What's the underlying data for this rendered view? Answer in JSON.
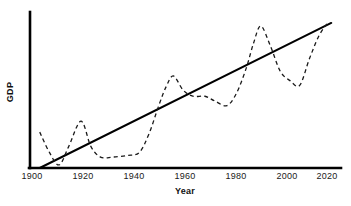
{
  "chart_data": {
    "type": "line",
    "title": "",
    "xlabel": "Year",
    "ylabel": "GDP",
    "xlim": [
      1896,
      2024
    ],
    "ylim": [
      0,
      100
    ],
    "grid": false,
    "legend": false,
    "xticks": [
      "1900",
      "1920",
      "1940",
      "1960",
      "1980",
      "2000",
      "2020"
    ],
    "xtick_values": [
      1900,
      1920,
      1940,
      1960,
      1980,
      2000,
      2020
    ],
    "yticks": [],
    "series": [
      {
        "name": "GDP trend",
        "style": "solid",
        "color": "#000000",
        "width": 2,
        "x": [
          1900,
          2020
        ],
        "values": [
          0,
          93
        ]
      },
      {
        "name": "GDP actual",
        "style": "dashed",
        "color": "#1a1a1a",
        "width": 1.3,
        "x": [
          1900,
          1904,
          1908,
          1912,
          1917,
          1921,
          1925,
          1930,
          1936,
          1941,
          1945,
          1949,
          1952,
          1955,
          1959,
          1963,
          1968,
          1972,
          1977,
          1981,
          1985,
          1988,
          1991,
          1995,
          1999,
          2003,
          2007,
          2011,
          2015,
          2019
        ],
        "values": [
          23,
          10,
          2,
          14,
          30,
          14,
          7,
          7,
          8,
          10,
          22,
          40,
          52,
          59,
          50,
          46,
          46,
          43,
          40,
          48,
          64,
          80,
          91,
          78,
          62,
          56,
          53,
          70,
          85,
          94
        ]
      }
    ]
  },
  "axes": {
    "x_title": "Year",
    "y_title": "GDP"
  }
}
